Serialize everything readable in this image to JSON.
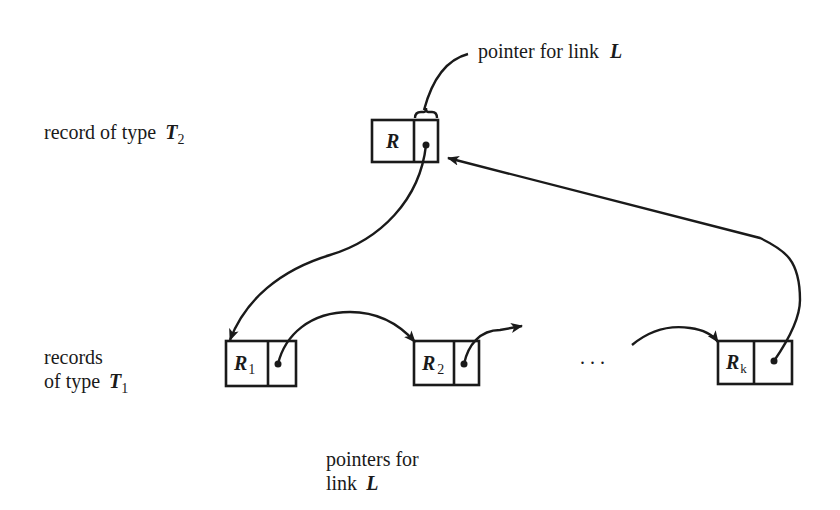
{
  "diagram": {
    "title_annotation": {
      "text": "pointer for link",
      "var": "L"
    },
    "owner": {
      "label_prefix": "record of type ",
      "label_var": "T",
      "label_sub": "2",
      "record": {
        "name": "R",
        "sub": ""
      }
    },
    "members": {
      "label_line1": "records",
      "label_line2_prefix": "of type ",
      "label_var": "T",
      "label_sub": "1",
      "records": [
        {
          "name": "R",
          "sub": "1"
        },
        {
          "name": "R",
          "sub": "2"
        },
        {
          "name": "R",
          "sub": "k"
        }
      ],
      "ellipsis": ". . ."
    },
    "bottom_annotation": {
      "line1": "pointers for",
      "line2_prefix": "link ",
      "var": "L"
    },
    "colors": {
      "ink": "#1a1a1a",
      "background": "#ffffff"
    }
  }
}
